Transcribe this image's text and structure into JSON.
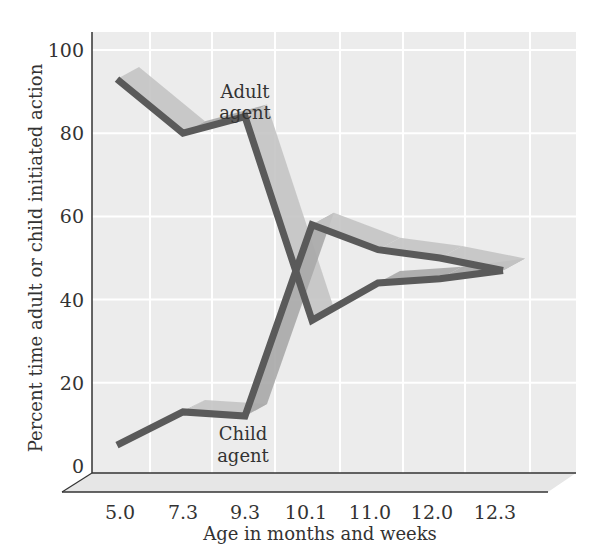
{
  "chart_data": {
    "type": "line",
    "title": "",
    "xlabel": "Age in months and weeks",
    "ylabel": "Percent time adult or child initiated action",
    "categories": [
      "5.0",
      "7.3",
      "9.3",
      "10.1",
      "11.0",
      "12.0",
      "12.3"
    ],
    "series": [
      {
        "name": "Adult agent",
        "values": [
          93,
          80,
          84,
          35,
          44,
          45,
          47
        ]
      },
      {
        "name": "Child agent",
        "values": [
          5,
          13,
          12,
          58,
          52,
          50,
          47
        ]
      }
    ],
    "yticks": [
      "0",
      "20",
      "40",
      "60",
      "80",
      "100"
    ],
    "ylim": [
      0,
      100
    ],
    "grid": true,
    "style": "3d ribbon",
    "annotations": [
      {
        "text_lines": [
          "Adult",
          "agent"
        ],
        "near_series": "Adult agent"
      },
      {
        "text_lines": [
          "Child",
          "agent"
        ],
        "near_series": "Child agent"
      }
    ],
    "legend": "none (inline labels)"
  },
  "colors": {
    "line": "#5a5a5a",
    "ribbon": "#c4c4c4",
    "ribbon_dark": "#a8a8a8",
    "panel": "#ececec",
    "grid": "#ffffff",
    "floor": "#e6e6e6"
  },
  "labels": {
    "xlabel": "Age in months and weeks",
    "ylabel": "Percent time adult or child initiated action",
    "adult_line1": "Adult",
    "adult_line2": "agent",
    "child_line1": "Child",
    "child_line2": "agent"
  }
}
